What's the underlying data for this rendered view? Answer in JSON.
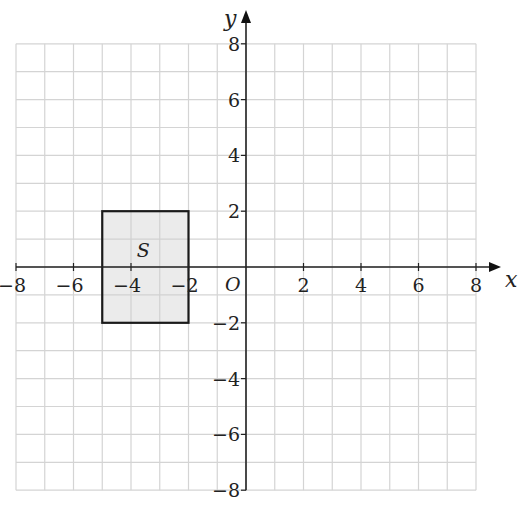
{
  "diagram": {
    "type": "coordinate-grid",
    "x_axis": {
      "label": "x",
      "min": -8,
      "max": 8,
      "tick_step": 2,
      "tick_labels": [
        "−8",
        "−6",
        "−4",
        "−2",
        "2",
        "4",
        "6",
        "8"
      ]
    },
    "y_axis": {
      "label": "y",
      "min": -8,
      "max": 8,
      "tick_step": 2,
      "tick_labels": [
        "8",
        "6",
        "4",
        "2",
        "−2",
        "−4",
        "−6",
        "−8"
      ]
    },
    "origin_label": "O",
    "grid": {
      "step": 1,
      "color": "#d4d4d4"
    },
    "shapes": [
      {
        "name": "S",
        "label": "S",
        "type": "rectangle",
        "x_min": -5,
        "x_max": -2,
        "y_min": -2,
        "y_max": 2,
        "fill": "#e8e8e8",
        "stroke": "#1a1a1a"
      }
    ]
  },
  "chart_data": {
    "type": "scatter",
    "title": "",
    "xlabel": "x",
    "ylabel": "y",
    "xlim": [
      -8,
      8
    ],
    "ylim": [
      -8,
      8
    ],
    "grid": true,
    "x_ticks": [
      -8,
      -6,
      -4,
      -2,
      2,
      4,
      6,
      8
    ],
    "y_ticks": [
      -8,
      -6,
      -4,
      -2,
      2,
      4,
      6,
      8
    ],
    "annotations": [
      "O",
      "S"
    ],
    "series": [
      {
        "name": "S",
        "shape": "rectangle",
        "x": [
          -5,
          -2,
          -2,
          -5,
          -5
        ],
        "y": [
          2,
          2,
          -2,
          -2,
          2
        ]
      }
    ]
  }
}
